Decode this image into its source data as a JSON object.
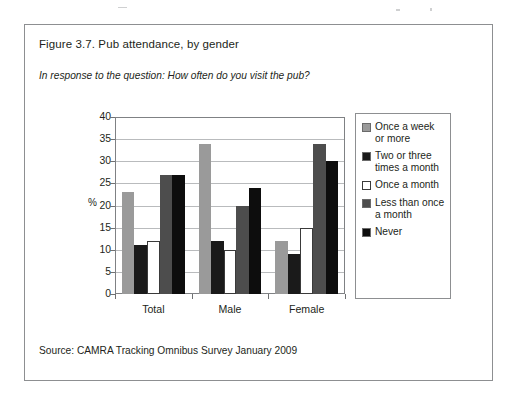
{
  "figure": {
    "title": "Figure 3.7. Pub attendance, by gender",
    "subtitle": "In response to the question: How often do you visit the pub?",
    "source": "Source: CAMRA Tracking Omnibus Survey January 2009"
  },
  "colors": {
    "series_1": "#9a9a9a",
    "series_2": "#1a1a1a",
    "series_3": "#ffffff",
    "series_4": "#4d4d4d",
    "series_5": "#0d0d0d",
    "frame": "#7f8184",
    "gridline": "#b9bbbd",
    "box_border": "#8d8f91",
    "text": "#231f20"
  },
  "chart_data": {
    "type": "bar",
    "title": "Figure 3.7. Pub attendance, by gender",
    "subtitle": "In response to the question: How often do you visit the pub?",
    "xlabel": "",
    "ylabel": "%",
    "ylim": [
      0,
      40
    ],
    "ytick_values": [
      0,
      5,
      10,
      15,
      20,
      25,
      30,
      35,
      40
    ],
    "ytick_labels": [
      "0",
      "5",
      "10",
      "15",
      "20",
      "25",
      "30",
      "35",
      "40"
    ],
    "grid": true,
    "legend_position": "right",
    "categories": [
      "Total",
      "Male",
      "Female"
    ],
    "series": [
      {
        "name": "Once a week or more",
        "values": [
          23,
          34,
          12
        ]
      },
      {
        "name": "Two or three times a month",
        "values": [
          11,
          12,
          9
        ]
      },
      {
        "name": "Once a month",
        "values": [
          12,
          10,
          15
        ]
      },
      {
        "name": "Less than once a month",
        "values": [
          27,
          20,
          34
        ]
      },
      {
        "name": "Never",
        "values": [
          27,
          24,
          30
        ]
      }
    ]
  },
  "legend": {
    "entries": [
      {
        "label": "Once a week or more"
      },
      {
        "label": "Two or three times a month"
      },
      {
        "label": "Once a month"
      },
      {
        "label": "Less than once a month"
      },
      {
        "label": "Never"
      }
    ]
  }
}
